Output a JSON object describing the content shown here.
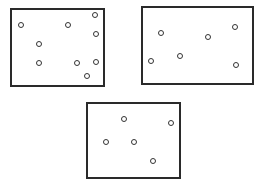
{
  "figure": {
    "stroke_color": "#2a2a2a",
    "background": "#ffffff",
    "panels": [
      {
        "id": "panel-1",
        "box": {
          "left": 10,
          "top": 8,
          "right": 105,
          "bottom": 87
        },
        "dot_count": 9,
        "dots": [
          {
            "x": 21,
            "y": 25
          },
          {
            "x": 68,
            "y": 25
          },
          {
            "x": 95,
            "y": 15
          },
          {
            "x": 96,
            "y": 34
          },
          {
            "x": 39,
            "y": 44
          },
          {
            "x": 39,
            "y": 63
          },
          {
            "x": 77,
            "y": 63
          },
          {
            "x": 96,
            "y": 62
          },
          {
            "x": 87,
            "y": 76
          }
        ]
      },
      {
        "id": "panel-2",
        "box": {
          "left": 141,
          "top": 6,
          "right": 254,
          "bottom": 85
        },
        "dot_count": 6,
        "dots": [
          {
            "x": 161,
            "y": 33
          },
          {
            "x": 208,
            "y": 37
          },
          {
            "x": 235,
            "y": 27
          },
          {
            "x": 151,
            "y": 61
          },
          {
            "x": 180,
            "y": 56
          },
          {
            "x": 236,
            "y": 65
          }
        ]
      },
      {
        "id": "panel-3",
        "box": {
          "left": 86,
          "top": 102,
          "right": 181,
          "bottom": 179
        },
        "dot_count": 5,
        "dots": [
          {
            "x": 124,
            "y": 119
          },
          {
            "x": 171,
            "y": 123
          },
          {
            "x": 106,
            "y": 142
          },
          {
            "x": 134,
            "y": 142
          },
          {
            "x": 153,
            "y": 161
          }
        ]
      }
    ]
  }
}
